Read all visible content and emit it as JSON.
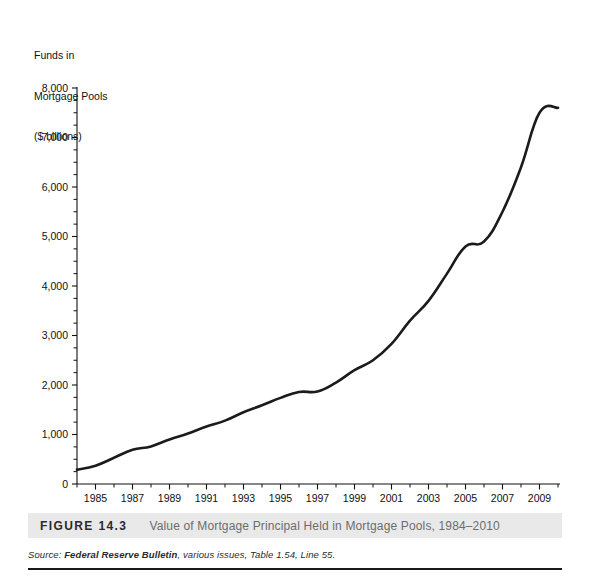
{
  "axis_title": {
    "line1": "Funds in",
    "line2": "Mortgage Pools",
    "line3": "($ billions)"
  },
  "caption": {
    "figure_number": "FIGURE 14.3",
    "title": "Value of Mortgage Principal Held in Mortgage Pools, 1984–2010"
  },
  "source": {
    "label": "Source:",
    "publication": "Federal Reserve Bulletin",
    "rest": ", various issues, Table 1.54, Line 55."
  },
  "chart_data": {
    "type": "line",
    "title": "Value of Mortgage Principal Held in Mortgage Pools, 1984–2010",
    "xlabel": "",
    "ylabel": "Funds in Mortgage Pools ($ billions)",
    "xlim": [
      1984,
      2010
    ],
    "ylim": [
      0,
      8000
    ],
    "grid": false,
    "legend": false,
    "y_major_ticks": [
      0,
      1000,
      2000,
      3000,
      4000,
      5000,
      6000,
      7000,
      8000
    ],
    "y_tick_labels": [
      "0",
      "1,000",
      "2,000",
      "3,000",
      "4,000",
      "5,000",
      "6,000",
      "7,000",
      "8,000"
    ],
    "y_minor_interval": 250,
    "x_major_ticks": [
      1985,
      1987,
      1989,
      1991,
      1993,
      1995,
      1997,
      1999,
      2001,
      2003,
      2005,
      2007,
      2009
    ],
    "x_tick_labels": [
      "1985",
      "1987",
      "1989",
      "1991",
      "1993",
      "1995",
      "1997",
      "1999",
      "2001",
      "2003",
      "2005",
      "2007",
      "2009"
    ],
    "x_minor_interval": 1,
    "line_color": "#1b1b1b",
    "x": [
      1984,
      1985,
      1986,
      1987,
      1988,
      1989,
      1990,
      1991,
      1992,
      1993,
      1994,
      1995,
      1996,
      1997,
      1998,
      1999,
      2000,
      2001,
      2002,
      2003,
      2004,
      2005,
      2006,
      2007,
      2008,
      2009,
      2010
    ],
    "values": [
      290,
      370,
      530,
      690,
      760,
      900,
      1020,
      1160,
      1280,
      1450,
      1590,
      1740,
      1860,
      1870,
      2050,
      2300,
      2500,
      2830,
      3300,
      3700,
      4250,
      4800,
      4900,
      5500,
      6400,
      7500,
      7600
    ],
    "series": [
      {
        "name": "Funds in Mortgage Pools",
        "units": "$ billions",
        "values": [
          290,
          370,
          530,
          690,
          760,
          900,
          1020,
          1160,
          1280,
          1450,
          1590,
          1740,
          1860,
          1870,
          2050,
          2300,
          2500,
          2830,
          3300,
          3700,
          4250,
          4800,
          4900,
          5500,
          6400,
          7500,
          7600
        ]
      }
    ],
    "annotations": [
      {
        "text": "plateau",
        "x_range": [
          1995,
          1997
        ],
        "approx_value": 1870
      },
      {
        "text": "plateau",
        "x_range": [
          2004,
          2006
        ],
        "approx_value": 4850
      },
      {
        "text": "peak then slight dip",
        "x_range": [
          2009,
          2010
        ],
        "approx_value": 7620
      }
    ]
  }
}
